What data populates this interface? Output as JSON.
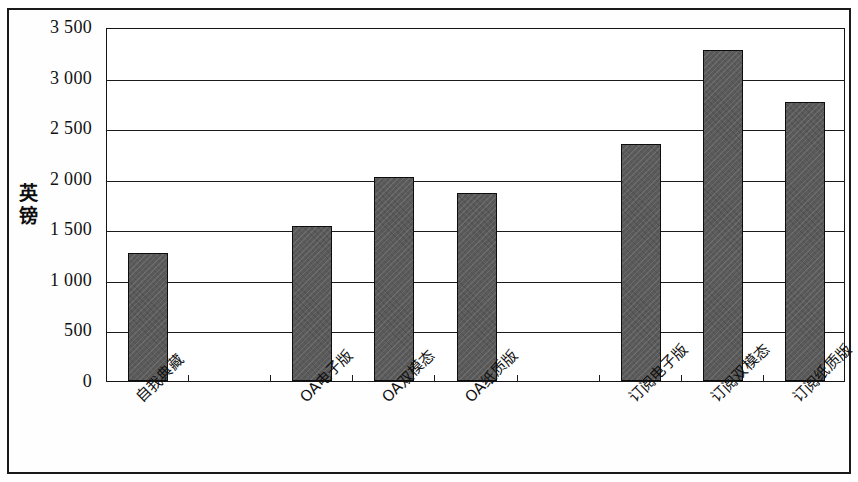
{
  "chart_data": {
    "type": "bar",
    "title": "",
    "subtitle": "",
    "xlabel": "",
    "ylabel": "英镑",
    "categories": [
      "自我典藏",
      "OA电子版",
      "OA双模态",
      "OA纸质版",
      "订阅电子版",
      "订阅双模态",
      "订阅纸质版"
    ],
    "values": [
      1270,
      1530,
      2020,
      1860,
      2340,
      3270,
      2760
    ],
    "ylim": [
      0,
      3500
    ],
    "ytick_values": [
      0,
      500,
      1000,
      1500,
      2000,
      2500,
      3000,
      3500
    ],
    "ytick_labels": [
      "0",
      "500",
      "1 000",
      "1 500",
      "2 000",
      "2 500",
      "3 000",
      "3 500"
    ],
    "grid": true,
    "legend": false,
    "legend_position": "none",
    "series": [
      {
        "name": "英镑",
        "values": [
          1270,
          1530,
          2020,
          1860,
          2340,
          3270,
          2760
        ]
      }
    ],
    "colors": {
      "bar_fill": "#5a5a5a",
      "bar_border": "#0d0d0d",
      "gridline": "#1c1c1c",
      "axis": "#141414",
      "frame": "#1a1a1a",
      "text": "#111111",
      "background": "#ffffff"
    },
    "bar_slots": 9,
    "bar_slot_index": [
      0,
      2,
      3,
      4,
      6,
      7,
      8
    ],
    "annotations": []
  }
}
